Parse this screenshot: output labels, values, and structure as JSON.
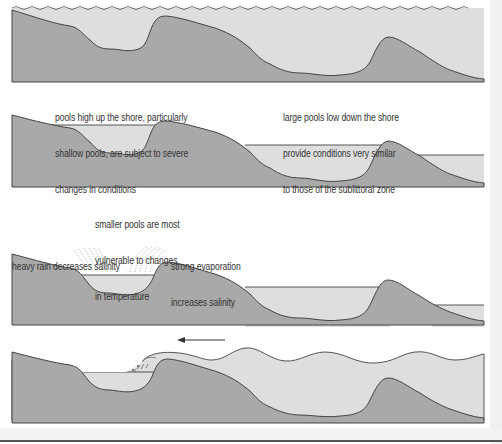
{
  "colors": {
    "ground": "#a9a9a9",
    "water": "#dedede",
    "outline": "#444444",
    "text": "#333333",
    "background": "#ffffff"
  },
  "panels": [
    {
      "id": 1,
      "description": "high tide - shore fully submerged",
      "annotations": []
    },
    {
      "id": 2,
      "description": "low tide - rock pools exposed",
      "annotations": [
        {
          "lines": [
            "pools high up the shore, particularly",
            "shallow pools, are subject to severe",
            "changes in conditions"
          ]
        },
        {
          "lines": [
            "large pools low down the shore",
            "provide conditions very similar",
            "to those of the sublittoral zone"
          ]
        }
      ]
    },
    {
      "id": 3,
      "description": "weather effects on pools",
      "annotations": [
        {
          "lines": [
            "smaller pools are most",
            "vulnerable to changes",
            "in temperature"
          ]
        },
        {
          "lines": [
            "heavy rain decreases salinity"
          ]
        },
        {
          "lines": [
            "strong evaporation",
            "increases salinity"
          ]
        }
      ]
    },
    {
      "id": 4,
      "description": "incoming tide wave splashing into high pool",
      "annotations": [],
      "arrow": {
        "direction": "left",
        "icon": "arrow-left-icon"
      }
    }
  ],
  "labels": {
    "high_pools_1": "pools high up the shore, particularly",
    "high_pools_2": "shallow pools, are subject to severe",
    "high_pools_3": "changes in conditions",
    "large_pools_1": "large pools low down the shore",
    "large_pools_2": "provide conditions very similar",
    "large_pools_3": "to those of the sublittoral zone",
    "small_pools_1": "smaller pools are most",
    "small_pools_2": "vulnerable to changes",
    "small_pools_3": "in temperature",
    "rain": "heavy rain decreases salinity",
    "evap_1": "strong evaporation",
    "evap_2": "increases salinity"
  }
}
